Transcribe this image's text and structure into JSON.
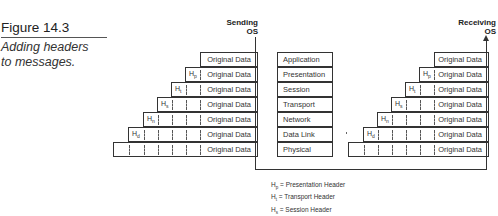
{
  "figure": {
    "title": "Figure 14.3",
    "caption_line1": "Adding headers",
    "caption_line2": "to messages."
  },
  "sending": {
    "label_line1": "Sending",
    "label_line2": "OS",
    "rows": [
      {
        "header": "",
        "data": "Original Data"
      },
      {
        "header": "Hp",
        "data": "Original Data"
      },
      {
        "header": "Ht",
        "data": "Original Data"
      },
      {
        "header": "Hs",
        "data": "Original Data"
      },
      {
        "header": "Hn",
        "data": "Original Data"
      },
      {
        "header": "Hd",
        "data": "Original Data"
      },
      {
        "header": "",
        "data": "Original Data"
      }
    ]
  },
  "receiving": {
    "label_line1": "Receiving",
    "label_line2": "OS",
    "rows": [
      {
        "header": "",
        "data": "Original Data"
      },
      {
        "header": "Hp",
        "data": "Original Data"
      },
      {
        "header": "Ht",
        "data": "Original Data"
      },
      {
        "header": "Hs",
        "data": "Original Data"
      },
      {
        "header": "Hn",
        "data": "Original Data"
      },
      {
        "header": "Hd",
        "data": "Original Data"
      },
      {
        "header": "",
        "data": "Original Data"
      }
    ]
  },
  "osi_layers": [
    "Application",
    "Presentation",
    "Session",
    "Transport",
    "Network",
    "Data Link",
    "Physical"
  ],
  "legend": [
    {
      "symbol": "H",
      "sub": "p",
      "text": "= Presentation Header"
    },
    {
      "symbol": "H",
      "sub": "t",
      "text": "= Transport Header"
    },
    {
      "symbol": "H",
      "sub": "s",
      "text": "= Session Header"
    },
    {
      "symbol": "H",
      "sub": "n",
      "text": "= Network Header"
    }
  ]
}
